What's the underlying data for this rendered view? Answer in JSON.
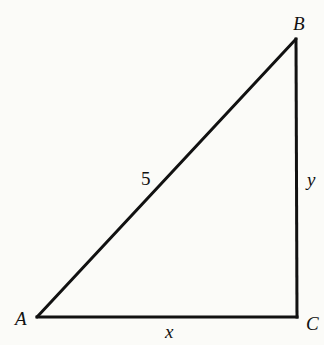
{
  "diagram": {
    "type": "right-triangle",
    "stroke_color": "#111111",
    "background_color": "#fbfbf8",
    "vertices": {
      "A": {
        "label": "A",
        "x": 37,
        "y": 317
      },
      "B": {
        "label": "B",
        "x": 296,
        "y": 39
      },
      "C": {
        "label": "C",
        "x": 297,
        "y": 317
      }
    },
    "sides": {
      "AB": {
        "label": "5",
        "description": "hypotenuse"
      },
      "BC": {
        "label": "y",
        "description": "vertical leg"
      },
      "AC": {
        "label": "x",
        "description": "horizontal leg"
      }
    },
    "right_angle_at": "C"
  }
}
